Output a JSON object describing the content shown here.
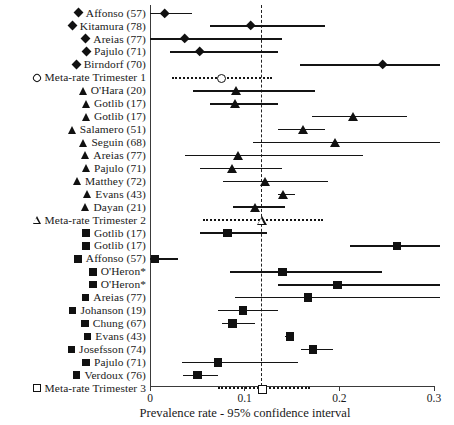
{
  "chart_data": {
    "type": "forest",
    "title": "",
    "xlabel": "Prevalence rate - 95% confidence interval",
    "ylabel": "",
    "xlim": [
      0,
      0.3
    ],
    "xticks": [
      0,
      0.1,
      0.2,
      0.3
    ],
    "xticklabels": [
      "0",
      "0.1",
      "0.2",
      "0.3"
    ],
    "grid": false,
    "reference_line": 0.118,
    "legend": "",
    "marker_legend": {
      "diamond": "Trimester 1 study",
      "diamond-open": "Trimester 1 meta-rate",
      "triangle": "Trimester 2 study",
      "triangle-open": "Trimester 2 meta-rate",
      "square": "Trimester 3 study",
      "square-open": "Trimester 3 meta-rate"
    },
    "rows": [
      {
        "label": "Affonso (57)",
        "marker": "diamond",
        "estimate": 0.016,
        "low": 0.0,
        "high": 0.044
      },
      {
        "label": "Kitamura (78)",
        "marker": "diamond",
        "estimate": 0.106,
        "low": 0.063,
        "high": 0.185
      },
      {
        "label": "Areias (77)",
        "marker": "diamond",
        "estimate": 0.037,
        "low": 0.0,
        "high": 0.139
      },
      {
        "label": "Pajulo (71)",
        "marker": "diamond",
        "estimate": 0.053,
        "low": 0.021,
        "high": 0.135
      },
      {
        "label": "Birndorf (70)",
        "marker": "diamond",
        "estimate": 0.246,
        "low": 0.158,
        "high": 0.306
      },
      {
        "label": "Meta-rate Trimester 1",
        "marker": "diamond-open",
        "estimate": 0.074,
        "low": 0.023,
        "high": 0.129
      },
      {
        "label": "O'Hara (20)",
        "marker": "triangle",
        "estimate": 0.091,
        "low": 0.045,
        "high": 0.174
      },
      {
        "label": "Gotlib (17)",
        "marker": "triangle",
        "estimate": 0.09,
        "low": 0.063,
        "high": 0.135
      },
      {
        "label": "Gotlib (17)",
        "marker": "triangle",
        "estimate": 0.214,
        "low": 0.171,
        "high": 0.272
      },
      {
        "label": "Salamero (51)",
        "marker": "triangle",
        "estimate": 0.162,
        "low": 0.135,
        "high": 0.185
      },
      {
        "label": "Seguin (68)",
        "marker": "triangle",
        "estimate": 0.195,
        "low": 0.109,
        "high": 0.306
      },
      {
        "label": "Areias (77)",
        "marker": "triangle",
        "estimate": 0.093,
        "low": 0.037,
        "high": 0.225
      },
      {
        "label": "Pajulo (71)",
        "marker": "triangle",
        "estimate": 0.087,
        "low": 0.053,
        "high": 0.139
      },
      {
        "label": "Matthey (72)",
        "marker": "triangle",
        "estimate": 0.121,
        "low": 0.077,
        "high": 0.188
      },
      {
        "label": "Evans (43)",
        "marker": "triangle",
        "estimate": 0.14,
        "low": 0.135,
        "high": 0.153
      },
      {
        "label": "Dayan (21)",
        "marker": "triangle",
        "estimate": 0.111,
        "low": 0.088,
        "high": 0.143
      },
      {
        "label": "Meta-rate Trimester 2",
        "marker": "triangle-open",
        "estimate": 0.118,
        "low": 0.056,
        "high": 0.183
      },
      {
        "label": "Gotlib (17)",
        "marker": "square",
        "estimate": 0.082,
        "low": 0.053,
        "high": 0.124
      },
      {
        "label": "Gotlib (17)",
        "marker": "square",
        "estimate": 0.261,
        "low": 0.211,
        "high": 0.306
      },
      {
        "label": "Affonso (57)",
        "marker": "square",
        "estimate": 0.005,
        "low": 0.0,
        "high": 0.03
      },
      {
        "label": "O'Heron*",
        "marker": "square",
        "estimate": 0.14,
        "low": 0.084,
        "high": 0.245
      },
      {
        "label": "O'Heron*",
        "marker": "square",
        "estimate": 0.198,
        "low": 0.135,
        "high": 0.306
      },
      {
        "label": "Areias (77)",
        "marker": "square",
        "estimate": 0.167,
        "low": 0.09,
        "high": 0.306
      },
      {
        "label": "Johanson (19)",
        "marker": "square",
        "estimate": 0.098,
        "low": 0.072,
        "high": 0.135
      },
      {
        "label": "Chung (67)",
        "marker": "square",
        "estimate": 0.087,
        "low": 0.076,
        "high": 0.111
      },
      {
        "label": "Evans (43)",
        "marker": "square",
        "estimate": 0.148,
        "low": 0.143,
        "high": 0.151
      },
      {
        "label": "Josefsson (74)",
        "marker": "square",
        "estimate": 0.172,
        "low": 0.159,
        "high": 0.193
      },
      {
        "label": "Pajulo (71)",
        "marker": "square",
        "estimate": 0.072,
        "low": 0.034,
        "high": 0.156
      },
      {
        "label": "Verdoux (76)",
        "marker": "square",
        "estimate": 0.05,
        "low": 0.035,
        "high": 0.072
      },
      {
        "label": "Meta-rate Trimester 3",
        "marker": "square-open",
        "estimate": 0.118,
        "low": 0.072,
        "high": 0.169
      }
    ]
  }
}
